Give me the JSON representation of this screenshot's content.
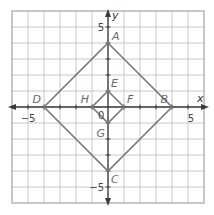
{
  "plane": {
    "x_range": [
      -6,
      6
    ],
    "y_range": [
      -6,
      6
    ],
    "unit_px": 16,
    "origin_px": [
      108,
      107
    ],
    "axis_labels": {
      "x": "x",
      "y": "y"
    },
    "origin_label": "0",
    "tick_labels": {
      "x_neg": "−5",
      "x_pos": "5",
      "y_pos": "5",
      "y_neg": "−5"
    }
  },
  "shapes": {
    "outer_square": {
      "vertices": [
        {
          "label": "A",
          "x": 0,
          "y": 4
        },
        {
          "label": "B",
          "x": 4,
          "y": 0
        },
        {
          "label": "C",
          "x": 0,
          "y": -4
        },
        {
          "label": "D",
          "x": -4,
          "y": 0
        }
      ]
    },
    "inner_square": {
      "vertices": [
        {
          "label": "E",
          "x": 0,
          "y": 1
        },
        {
          "label": "F",
          "x": 1,
          "y": 0
        },
        {
          "label": "G",
          "x": 0,
          "y": -1
        },
        {
          "label": "H",
          "x": -1,
          "y": 0
        }
      ]
    }
  },
  "colors": {
    "grid": "#c8c8c8",
    "axis": "#3a3a3a",
    "shape": "#7a7a7a",
    "label": "#6a6a6a"
  }
}
